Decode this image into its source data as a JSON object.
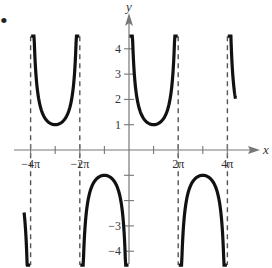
{
  "marker": "•",
  "chart_data": {
    "type": "line",
    "title": "",
    "function": "y = csc(x/2)",
    "xlabel": "x",
    "ylabel": "y",
    "x_ticks": [
      {
        "value": -12.566,
        "label": "−4π"
      },
      {
        "value": -9.425,
        "label": ""
      },
      {
        "value": -6.283,
        "label": "−2π"
      },
      {
        "value": -3.142,
        "label": ""
      },
      {
        "value": 3.142,
        "label": ""
      },
      {
        "value": 6.283,
        "label": "2π"
      },
      {
        "value": 9.425,
        "label": ""
      },
      {
        "value": 12.566,
        "label": "4π"
      }
    ],
    "y_ticks": [
      {
        "value": 4,
        "label": "4"
      },
      {
        "value": 3,
        "label": "3"
      },
      {
        "value": 2,
        "label": "2"
      },
      {
        "value": 1,
        "label": "1"
      },
      {
        "value": -1,
        "label": ""
      },
      {
        "value": -2,
        "label": ""
      },
      {
        "value": -3,
        "label": "−3"
      },
      {
        "value": -4,
        "label": "−4"
      }
    ],
    "asymptotes": [
      -12.566,
      -6.283,
      0,
      6.283,
      12.566
    ],
    "xlim": [
      -13.8,
      14.2
    ],
    "ylim": [
      -4.5,
      4.6
    ],
    "grid": false,
    "legend": null,
    "branches": [
      {
        "x_range": [
          -13.4,
          -12.62
        ],
        "direction": "down",
        "note": "partial lower branch left of -4π"
      },
      {
        "x_range": [
          -12.5,
          -6.35
        ],
        "extremum": {
          "x": -9.425,
          "y": 1
        },
        "direction": "up"
      },
      {
        "x_range": [
          -6.22,
          -0.06
        ],
        "extremum": {
          "x": -3.142,
          "y": -1
        },
        "direction": "down"
      },
      {
        "x_range": [
          0.06,
          6.22
        ],
        "extremum": {
          "x": 3.142,
          "y": 1
        },
        "direction": "up"
      },
      {
        "x_range": [
          6.35,
          12.5
        ],
        "extremum": {
          "x": 9.425,
          "y": -1
        },
        "direction": "down"
      },
      {
        "x_range": [
          12.62,
          13.6
        ],
        "direction": "up",
        "note": "partial upper branch right of 4π"
      }
    ]
  }
}
